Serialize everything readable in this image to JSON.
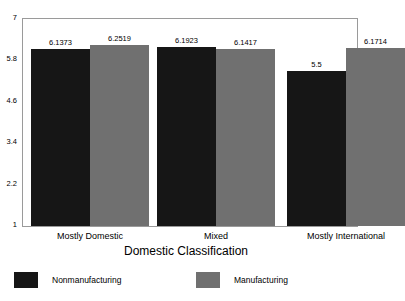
{
  "chart_data": {
    "type": "bar",
    "title": "",
    "subtitle": "",
    "xlabel": "Domestic Classification",
    "ylabel": "",
    "categories": [
      "Mostly Domestic",
      "Mixed",
      "Mostly International"
    ],
    "series": [
      {
        "name": "Nonmanufacturing",
        "color": "#161616",
        "values": [
          6.1373,
          6.1923,
          5.5
        ],
        "labels": [
          "6.1373",
          "6.1923",
          "5.5"
        ]
      },
      {
        "name": "Manufacturing",
        "color": "#707070",
        "values": [
          6.2519,
          6.1417,
          6.1714
        ],
        "labels": [
          "6.2519",
          "6.1417",
          "6.1714"
        ]
      }
    ],
    "ylim": [
      1,
      7
    ],
    "yticks": [
      7,
      5.8,
      4.6,
      3.4,
      2.2,
      1
    ],
    "ytick_labels": [
      "7",
      "5.8",
      "4.6",
      "3.4",
      "2.2",
      "1"
    ],
    "grid": false,
    "legend_position": "bottom",
    "bar_baseline": 1
  },
  "axis": {
    "y_labels": [
      "7",
      "5.8",
      "4.6",
      "3.4",
      "2.2",
      "1"
    ],
    "x_title": "Domestic Classification"
  },
  "legend": {
    "items": [
      {
        "label": "Nonmanufacturing",
        "color": "#161616"
      },
      {
        "label": "Manufacturing",
        "color": "#707070"
      }
    ]
  },
  "colors": {
    "nonmanufacturing": "#161616",
    "manufacturing": "#707070",
    "frame": "#9a9a9a",
    "background": "#ffffff"
  }
}
